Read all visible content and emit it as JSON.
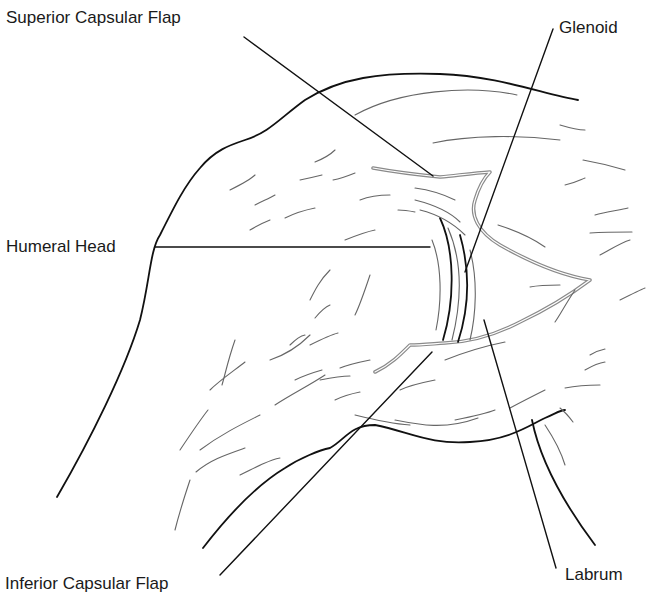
{
  "diagram": {
    "type": "anatomical-line-drawing",
    "labels": {
      "superior_capsular_flap": "Superior Capsular Flap",
      "glenoid": "Glenoid",
      "humeral_head": "Humeral Head",
      "inferior_capsular_flap": "Inferior Capsular Flap",
      "labrum": "Labrum"
    },
    "colors": {
      "outline": "#111111",
      "capsule_edge": "#8a8a8a",
      "hatching": "#666666",
      "background": "#ffffff"
    }
  }
}
